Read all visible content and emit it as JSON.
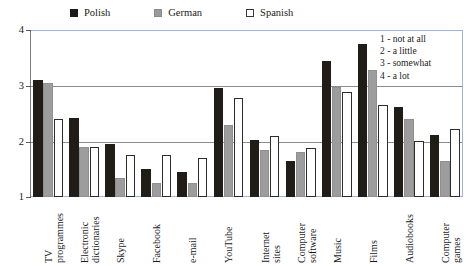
{
  "legend": {
    "items": [
      {
        "label": "Polish",
        "icon": "filled-square-icon",
        "color": "#1a1a1a"
      },
      {
        "label": "German",
        "icon": "gray-square-icon",
        "color": "#9a9a9a"
      },
      {
        "label": "Spanish",
        "icon": "outline-square-icon",
        "color": "#ffffff"
      }
    ]
  },
  "scale_key": {
    "lines": [
      "1 - not at all",
      "2 - a little",
      "3 - somewhat",
      "4 - a lot"
    ]
  },
  "axis": {
    "y_ticks": [
      "4",
      "3",
      "2",
      "1"
    ]
  },
  "chart_data": {
    "type": "bar",
    "title": "",
    "subtitle": "",
    "xlabel": "",
    "ylabel": "",
    "ylim": [
      1,
      4
    ],
    "yticks": [
      1,
      2,
      3,
      4
    ],
    "grid": true,
    "legend_position": "top",
    "annotations": [
      "1 - not at all",
      "2 - a little",
      "3 - somewhat",
      "4 - a lot"
    ],
    "categories": [
      "TV programmes",
      "Electronic dictionaries",
      "Skype",
      "Facebook",
      "e-mail",
      "YouTube",
      "Internet sites",
      "Computer software",
      "Music",
      "Films",
      "Audiobooks",
      "Computer games"
    ],
    "category_lines": [
      [
        "TV",
        "programmes"
      ],
      [
        "Electronic",
        "dictionaries"
      ],
      [
        "Skype",
        ""
      ],
      [
        "Facebook",
        ""
      ],
      [
        "e-mail",
        ""
      ],
      [
        "YouTube",
        ""
      ],
      [
        "Internet",
        "sites"
      ],
      [
        "Computer",
        "software"
      ],
      [
        "Music",
        ""
      ],
      [
        "Films",
        ""
      ],
      [
        "Audiobooks",
        ""
      ],
      [
        "Computer",
        "games"
      ]
    ],
    "series": [
      {
        "name": "Polish",
        "color": "#1a1a1a",
        "values": [
          3.1,
          2.42,
          1.95,
          1.5,
          1.45,
          2.95,
          2.02,
          1.65,
          3.45,
          3.75,
          2.62,
          2.12
        ]
      },
      {
        "name": "German",
        "color": "#9a9a9a",
        "values": [
          3.05,
          1.9,
          1.35,
          1.25,
          1.25,
          2.3,
          1.85,
          1.8,
          2.98,
          3.28,
          2.4,
          1.65
        ]
      },
      {
        "name": "Spanish",
        "color": "#ffffff",
        "values": [
          2.4,
          1.9,
          1.75,
          1.75,
          1.7,
          2.78,
          2.1,
          1.88,
          2.88,
          2.65,
          2.0,
          2.22
        ]
      }
    ]
  }
}
